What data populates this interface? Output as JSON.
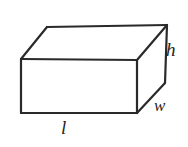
{
  "figure": {
    "kind": "rectangular-prism-diagram",
    "background_color": "#ffffff",
    "stroke_color": "#2a2a2a",
    "face_fill_color": "#ffffff",
    "stroke_width": 2.2,
    "labels": {
      "height": "h",
      "width": "w",
      "length": "l"
    },
    "geometry": {
      "front_top_left": [
        21,
        59
      ],
      "front_top_right": [
        137,
        60
      ],
      "front_bottom_right": [
        137,
        113
      ],
      "front_bottom_left": [
        21,
        113
      ],
      "back_top_left": [
        47,
        27
      ],
      "back_top_right": [
        167,
        25
      ],
      "back_bottom_right": [
        165,
        83
      ]
    },
    "label_positions": {
      "height": [
        173,
        50
      ],
      "width": [
        161,
        106
      ],
      "length": [
        66,
        128
      ]
    }
  }
}
